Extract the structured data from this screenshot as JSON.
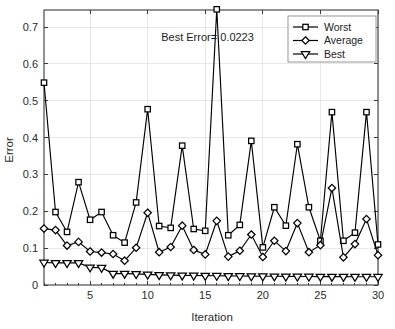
{
  "chart_data": {
    "type": "line",
    "title": "",
    "xlabel": "Iteration",
    "ylabel": "Error",
    "xlim": [
      1,
      30
    ],
    "ylim": [
      0,
      0.75
    ],
    "x_ticks": [
      5,
      10,
      15,
      20,
      25,
      30
    ],
    "y_ticks": [
      "0",
      "0.1",
      "0.2",
      "0.3",
      "0.4",
      "0.5",
      "0.6",
      "0.7"
    ],
    "y_tick_values": [
      0,
      0.1,
      0.2,
      0.3,
      0.4,
      0.5,
      0.6,
      0.7
    ],
    "grid": true,
    "legend_position": "top-right",
    "x": [
      1,
      2,
      3,
      4,
      5,
      6,
      7,
      8,
      9,
      10,
      11,
      12,
      13,
      14,
      15,
      16,
      17,
      18,
      19,
      20,
      21,
      22,
      23,
      24,
      25,
      26,
      27,
      28,
      29,
      30
    ],
    "series": [
      {
        "name": "Worst",
        "marker": "square",
        "values": [
          0.549,
          0.198,
          0.144,
          0.279,
          0.177,
          0.198,
          0.135,
          0.115,
          0.224,
          0.477,
          0.16,
          0.155,
          0.378,
          0.152,
          0.147,
          0.748,
          0.135,
          0.163,
          0.391,
          0.102,
          0.211,
          0.161,
          0.382,
          0.211,
          0.12,
          0.469,
          0.12,
          0.142,
          0.469,
          0.11
        ]
      },
      {
        "name": "Average",
        "marker": "diamond",
        "values": [
          0.153,
          0.149,
          0.107,
          0.117,
          0.091,
          0.088,
          0.084,
          0.066,
          0.101,
          0.196,
          0.089,
          0.103,
          0.161,
          0.095,
          0.083,
          0.174,
          0.077,
          0.093,
          0.137,
          0.076,
          0.12,
          0.092,
          0.168,
          0.089,
          0.108,
          0.263,
          0.075,
          0.111,
          0.179,
          0.081
        ]
      },
      {
        "name": "Best",
        "marker": "triangle-down",
        "values": [
          0.061,
          0.06,
          0.06,
          0.06,
          0.048,
          0.047,
          0.031,
          0.031,
          0.03,
          0.0287,
          0.0275,
          0.0268,
          0.0262,
          0.0258,
          0.0254,
          0.025,
          0.0246,
          0.0243,
          0.024,
          0.0238,
          0.0236,
          0.0234,
          0.0232,
          0.023,
          0.0229,
          0.0228,
          0.0226,
          0.0225,
          0.0224,
          0.0223
        ]
      }
    ],
    "annotations": [
      {
        "text": "Best Error= 0.0223",
        "x": 15.2,
        "y": 0.663
      }
    ]
  },
  "legend": {
    "entries": [
      {
        "label": "Worst"
      },
      {
        "label": "Average"
      },
      {
        "label": "Best"
      }
    ]
  },
  "colors": {
    "line": "#000000",
    "marker_fill": "#ffffff",
    "grid": "#e2e2e2",
    "axis": "#3a3a3a",
    "background": "#ffffff"
  }
}
